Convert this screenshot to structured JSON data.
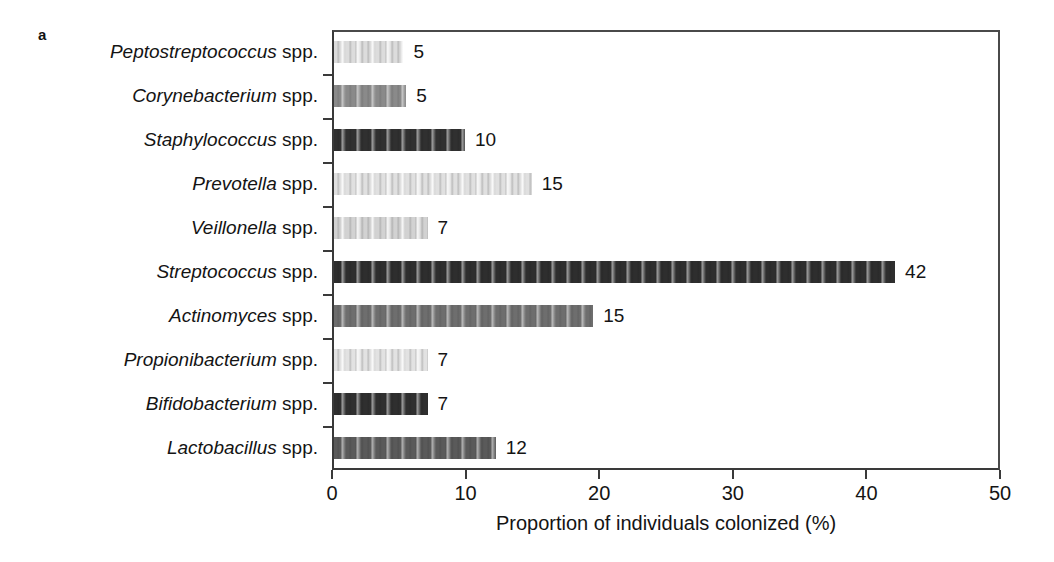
{
  "figure": {
    "panel_label": "a"
  },
  "chart_data": {
    "type": "bar",
    "orientation": "horizontal",
    "title": "",
    "xlabel": "Proportion of individuals colonized (%)",
    "ylabel": "",
    "xlim": [
      0,
      50
    ],
    "xticks": [
      0,
      10,
      20,
      30,
      40,
      50
    ],
    "xtick_labels": [
      "0",
      "10",
      "20",
      "30",
      "40",
      "50"
    ],
    "grid": false,
    "legend": "none",
    "categories": [
      "Peptostreptococcus spp.",
      "Corynebacterium spp.",
      "Staphylococcus spp.",
      "Prevotella spp.",
      "Veillonella spp.",
      "Streptococcus spp.",
      "Actinomyces spp.",
      "Propionibacterium spp.",
      "Bifidobacterium spp.",
      "Lactobacillus spp."
    ],
    "values": [
      5,
      5,
      10,
      15,
      7,
      42,
      15,
      7,
      7,
      12
    ],
    "bars": [
      {
        "genus": "Peptostreptococcus",
        "suffix": " spp.",
        "value": 5,
        "value_label": "5",
        "drawn_length": 5.2,
        "fill": "#dcdcdc"
      },
      {
        "genus": "Corynebacterium",
        "suffix": " spp.",
        "value": 5,
        "value_label": "5",
        "drawn_length": 5.4,
        "fill": "#8a8a8a"
      },
      {
        "genus": "Staphylococcus",
        "suffix": " spp.",
        "value": 10,
        "value_label": "10",
        "drawn_length": 9.8,
        "fill": "#303030"
      },
      {
        "genus": "Prevotella",
        "suffix": " spp.",
        "value": 15,
        "value_label": "15",
        "drawn_length": 14.8,
        "fill": "#e0e0e0"
      },
      {
        "genus": "Veillonella",
        "suffix": " spp.",
        "value": 7,
        "value_label": "7",
        "drawn_length": 7.0,
        "fill": "#d2d2d2"
      },
      {
        "genus": "Streptococcus",
        "suffix": " spp.",
        "value": 42,
        "value_label": "42",
        "drawn_length": 42.0,
        "fill": "#2e2e2e"
      },
      {
        "genus": "Actinomyces",
        "suffix": " spp.",
        "value": 15,
        "value_label": "15",
        "drawn_length": 19.4,
        "fill": "#6e6e6e"
      },
      {
        "genus": "Propionibacterium",
        "suffix": " spp.",
        "value": 7,
        "value_label": "7",
        "drawn_length": 7.0,
        "fill": "#e2e2e2"
      },
      {
        "genus": "Bifidobacterium",
        "suffix": " spp.",
        "value": 7,
        "value_label": "7",
        "drawn_length": 7.0,
        "fill": "#2f2f2f"
      },
      {
        "genus": "Lactobacillus",
        "suffix": " spp.",
        "value": 12,
        "value_label": "12",
        "drawn_length": 12.1,
        "fill": "#5a5a5a"
      }
    ]
  }
}
